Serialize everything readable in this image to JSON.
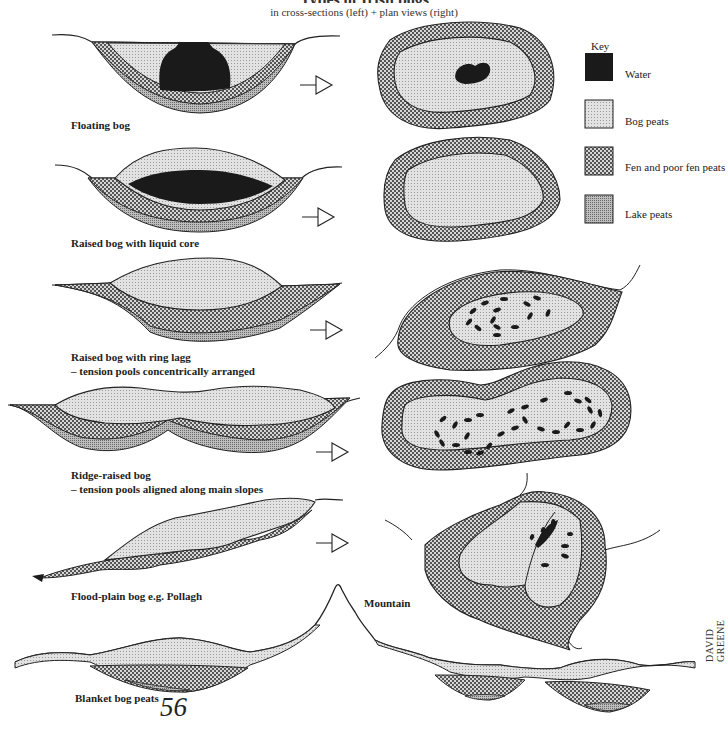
{
  "title_partial": "Types of Irish bogs",
  "subtitle": "in cross-sections (left) + plan views (right)",
  "key": {
    "title": "Key",
    "items": [
      {
        "label": "Water",
        "fill": "#1a1a1a",
        "pattern": "solid"
      },
      {
        "label": "Bog peats",
        "fill": "#dcdcdc",
        "pattern": "fine-stipple"
      },
      {
        "label": "Fen and poor fen peats",
        "fill": "#a8a8a8",
        "pattern": "checker"
      },
      {
        "label": "Lake peats",
        "fill": "#9a9a9a",
        "pattern": "dense-stipple"
      }
    ]
  },
  "bog_types": [
    {
      "label": "Floating bog",
      "subnote": ""
    },
    {
      "label": "Raised bog with liquid core",
      "subnote": ""
    },
    {
      "label": "Raised bog with ring lagg",
      "subnote": "– tension pools concentrically arranged"
    },
    {
      "label": "Ridge-raised bog",
      "subnote": "– tension pools aligned along main slopes"
    },
    {
      "label": "Flood-plain bog e.g. Pollagh",
      "subnote": ""
    },
    {
      "label": "Blanket bog peats",
      "subnote": ""
    }
  ],
  "annotations": {
    "mountain": "Mountain"
  },
  "page_number": "56",
  "credit": "DAVID GREENE"
}
